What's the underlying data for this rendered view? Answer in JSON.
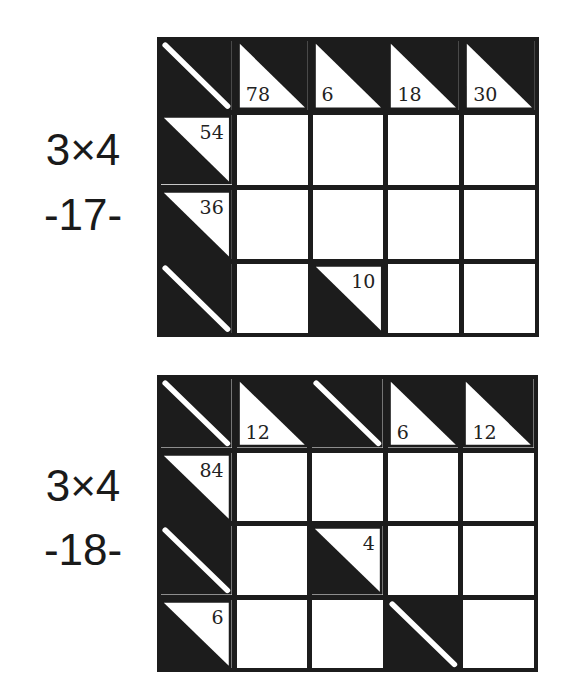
{
  "puzzles": [
    {
      "label_size": "3×4",
      "label_number": "-17-",
      "cols": 5,
      "rows": 4,
      "cells": [
        [
          {
            "type": "empty-clue"
          },
          {
            "type": "col-clue",
            "value": "78"
          },
          {
            "type": "col-clue",
            "value": "6"
          },
          {
            "type": "col-clue",
            "value": "18"
          },
          {
            "type": "col-clue",
            "value": "30"
          }
        ],
        [
          {
            "type": "row-clue",
            "value": "54"
          },
          {
            "type": "white"
          },
          {
            "type": "white"
          },
          {
            "type": "white"
          },
          {
            "type": "white"
          }
        ],
        [
          {
            "type": "row-clue",
            "value": "36"
          },
          {
            "type": "white"
          },
          {
            "type": "white"
          },
          {
            "type": "white"
          },
          {
            "type": "white"
          }
        ],
        [
          {
            "type": "empty-clue"
          },
          {
            "type": "white"
          },
          {
            "type": "row-clue",
            "value": "10"
          },
          {
            "type": "white"
          },
          {
            "type": "white"
          }
        ]
      ]
    },
    {
      "label_size": "3×4",
      "label_number": "-18-",
      "cols": 5,
      "rows": 4,
      "cells": [
        [
          {
            "type": "empty-clue"
          },
          {
            "type": "col-clue",
            "value": "12"
          },
          {
            "type": "empty-clue"
          },
          {
            "type": "col-clue",
            "value": "6"
          },
          {
            "type": "col-clue",
            "value": "12"
          }
        ],
        [
          {
            "type": "row-clue",
            "value": "84"
          },
          {
            "type": "white"
          },
          {
            "type": "white"
          },
          {
            "type": "white"
          },
          {
            "type": "white"
          }
        ],
        [
          {
            "type": "empty-clue"
          },
          {
            "type": "white"
          },
          {
            "type": "row-clue",
            "value": "4"
          },
          {
            "type": "white"
          },
          {
            "type": "white"
          }
        ],
        [
          {
            "type": "row-clue",
            "value": "6"
          },
          {
            "type": "white"
          },
          {
            "type": "white"
          },
          {
            "type": "empty-clue"
          },
          {
            "type": "white"
          }
        ]
      ]
    }
  ],
  "colors": {
    "ink": "#1c1c1c",
    "paper": "#ffffff"
  }
}
